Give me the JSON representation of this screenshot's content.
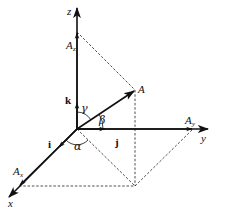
{
  "diagram": {
    "axes": {
      "x_label": "x",
      "y_label": "y",
      "z_label": "z"
    },
    "unit_vectors": {
      "i": "i",
      "j": "j",
      "k": "k"
    },
    "vector": {
      "label": "A"
    },
    "components": {
      "x": {
        "main": "A",
        "sub": "x"
      },
      "y": {
        "main": "A",
        "sub": "y"
      },
      "z": {
        "main": "A",
        "sub": "z"
      }
    },
    "angles": {
      "alpha": "α",
      "beta": "β",
      "gamma": "γ"
    }
  }
}
